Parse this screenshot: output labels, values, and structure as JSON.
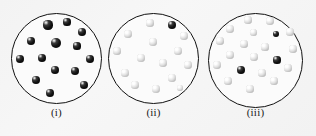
{
  "figure": {
    "background_color": "#f4f4f4",
    "width": 316,
    "height": 136
  },
  "colors": {
    "circle_outline": "#111111",
    "circle_fill": "#fbfbfb",
    "dark_sphere": "#101010",
    "light_sphere": "#dedede",
    "caption_text": "#1a1a1a"
  },
  "panels": [
    {
      "id": "panel-i",
      "caption": "(i)",
      "caption_y": 106,
      "circle": {
        "left": 11,
        "top": 13,
        "diameter": 91
      },
      "dark_count": 14,
      "light_count": 0,
      "dots": [
        {
          "x": 37,
          "y": 12,
          "r": 4.6,
          "shade": "dark"
        },
        {
          "x": 56,
          "y": 9,
          "r": 3.6,
          "shade": "dark"
        },
        {
          "x": 71,
          "y": 19,
          "r": 4.2,
          "shade": "dark"
        },
        {
          "x": 20,
          "y": 28,
          "r": 4.0,
          "shade": "dark"
        },
        {
          "x": 45,
          "y": 30,
          "r": 5.0,
          "shade": "dark"
        },
        {
          "x": 66,
          "y": 33,
          "r": 3.6,
          "shade": "dark"
        },
        {
          "x": 9,
          "y": 46,
          "r": 4.2,
          "shade": "dark"
        },
        {
          "x": 31,
          "y": 45,
          "r": 4.3,
          "shade": "dark"
        },
        {
          "x": 79,
          "y": 46,
          "r": 4.3,
          "shade": "dark"
        },
        {
          "x": 44,
          "y": 57,
          "r": 4.4,
          "shade": "dark"
        },
        {
          "x": 64,
          "y": 58,
          "r": 4.3,
          "shade": "dark"
        },
        {
          "x": 25,
          "y": 67,
          "r": 4.3,
          "shade": "dark"
        },
        {
          "x": 73,
          "y": 72,
          "r": 4.4,
          "shade": "dark"
        },
        {
          "x": 39,
          "y": 80,
          "r": 4.3,
          "shade": "dark"
        }
      ]
    },
    {
      "id": "panel-ii",
      "caption": "(ii)",
      "caption_y": 106,
      "circle": {
        "left": 108,
        "top": 13,
        "diameter": 91
      },
      "dark_count": 1,
      "light_count": 14,
      "dots": [
        {
          "x": 42,
          "y": 10,
          "r": 3.8,
          "shade": "light"
        },
        {
          "x": 64,
          "y": 12,
          "r": 4.2,
          "shade": "dark"
        },
        {
          "x": 20,
          "y": 21,
          "r": 4.0,
          "shade": "light"
        },
        {
          "x": 76,
          "y": 23,
          "r": 4.0,
          "shade": "light"
        },
        {
          "x": 45,
          "y": 29,
          "r": 3.9,
          "shade": "light"
        },
        {
          "x": 9,
          "y": 38,
          "r": 3.8,
          "shade": "light"
        },
        {
          "x": 70,
          "y": 38,
          "r": 4.0,
          "shade": "light"
        },
        {
          "x": 33,
          "y": 45,
          "r": 4.4,
          "shade": "light"
        },
        {
          "x": 55,
          "y": 50,
          "r": 4.0,
          "shade": "light"
        },
        {
          "x": 80,
          "y": 52,
          "r": 3.9,
          "shade": "light"
        },
        {
          "x": 17,
          "y": 60,
          "r": 3.9,
          "shade": "light"
        },
        {
          "x": 64,
          "y": 65,
          "r": 3.9,
          "shade": "light"
        },
        {
          "x": 27,
          "y": 72,
          "r": 3.9,
          "shade": "light"
        },
        {
          "x": 48,
          "y": 76,
          "r": 4.0,
          "shade": "light"
        },
        {
          "x": 72,
          "y": 75,
          "r": 3.4,
          "shade": "light"
        }
      ]
    },
    {
      "id": "panel-iii",
      "caption": "(iii)",
      "caption_y": 106,
      "circle": {
        "left": 208,
        "top": 13,
        "diameter": 95
      },
      "dark_count": 3,
      "light_count": 17,
      "dots": [
        {
          "x": 40,
          "y": 7,
          "r": 3.8,
          "shade": "light"
        },
        {
          "x": 62,
          "y": 8,
          "r": 3.9,
          "shade": "light"
        },
        {
          "x": 22,
          "y": 16,
          "r": 3.9,
          "shade": "light"
        },
        {
          "x": 45,
          "y": 19,
          "r": 3.5,
          "shade": "light"
        },
        {
          "x": 68,
          "y": 21,
          "r": 3.4,
          "shade": "dark"
        },
        {
          "x": 82,
          "y": 19,
          "r": 3.8,
          "shade": "light"
        },
        {
          "x": 12,
          "y": 28,
          "r": 3.8,
          "shade": "light"
        },
        {
          "x": 36,
          "y": 31,
          "r": 3.8,
          "shade": "light"
        },
        {
          "x": 57,
          "y": 34,
          "r": 3.6,
          "shade": "light"
        },
        {
          "x": 85,
          "y": 36,
          "r": 3.8,
          "shade": "light"
        },
        {
          "x": 22,
          "y": 42,
          "r": 3.9,
          "shade": "light"
        },
        {
          "x": 46,
          "y": 44,
          "r": 3.7,
          "shade": "light"
        },
        {
          "x": 69,
          "y": 47,
          "r": 3.6,
          "shade": "dark"
        },
        {
          "x": 9,
          "y": 52,
          "r": 3.9,
          "shade": "light"
        },
        {
          "x": 33,
          "y": 57,
          "r": 3.9,
          "shade": "dark"
        },
        {
          "x": 80,
          "y": 55,
          "r": 3.8,
          "shade": "light"
        },
        {
          "x": 54,
          "y": 60,
          "r": 3.8,
          "shade": "light"
        },
        {
          "x": 20,
          "y": 68,
          "r": 3.8,
          "shade": "light"
        },
        {
          "x": 66,
          "y": 68,
          "r": 3.7,
          "shade": "light"
        },
        {
          "x": 42,
          "y": 76,
          "r": 3.8,
          "shade": "light"
        }
      ]
    }
  ]
}
